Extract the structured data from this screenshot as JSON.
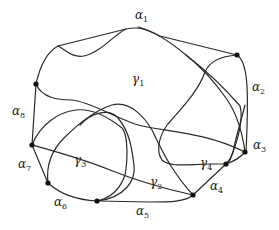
{
  "diagram": {
    "type": "curve-arrangement",
    "colors": {
      "stroke": "#2a2a2a",
      "vertex": "#111111",
      "background": "#ffffff"
    },
    "vertices": [
      {
        "id": "v1",
        "x": 36,
        "y": 84
      },
      {
        "id": "v2",
        "x": 237,
        "y": 55
      },
      {
        "id": "v3",
        "x": 245,
        "y": 152
      },
      {
        "id": "v4",
        "x": 226,
        "y": 164
      },
      {
        "id": "v5",
        "x": 193,
        "y": 195
      },
      {
        "id": "v6",
        "x": 97,
        "y": 201
      },
      {
        "id": "v7",
        "x": 48,
        "y": 183
      },
      {
        "id": "v8",
        "x": 32,
        "y": 145
      }
    ],
    "arc_labels": [
      {
        "id": "alpha1",
        "base": "α",
        "sub": "1",
        "x": 135,
        "y": 19
      },
      {
        "id": "alpha2",
        "base": "α",
        "sub": "2",
        "x": 252,
        "y": 91
      },
      {
        "id": "alpha3",
        "base": "α",
        "sub": "3",
        "x": 253,
        "y": 149
      },
      {
        "id": "alpha4",
        "base": "α",
        "sub": "4",
        "x": 210,
        "y": 190
      },
      {
        "id": "alpha5",
        "base": "α",
        "sub": "5",
        "x": 136,
        "y": 215
      },
      {
        "id": "alpha6",
        "base": "α",
        "sub": "6",
        "x": 54,
        "y": 206
      },
      {
        "id": "alpha7",
        "base": "α",
        "sub": "7",
        "x": 18,
        "y": 168
      },
      {
        "id": "alpha8",
        "base": "α",
        "sub": "8",
        "x": 12,
        "y": 115
      }
    ],
    "region_labels": [
      {
        "id": "gamma1",
        "base": "γ",
        "sub": "1",
        "x": 132,
        "y": 83
      },
      {
        "id": "gamma2",
        "base": "γ",
        "sub": "2",
        "x": 150,
        "y": 186
      },
      {
        "id": "gamma3",
        "base": "γ",
        "sub": "3",
        "x": 74,
        "y": 164
      },
      {
        "id": "gamma4",
        "base": "γ",
        "sub": "4",
        "x": 200,
        "y": 167
      }
    ]
  }
}
